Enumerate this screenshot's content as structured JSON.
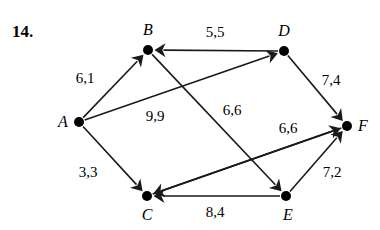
{
  "problem": {
    "number": "14."
  },
  "graph": {
    "nodes": [
      {
        "id": "A",
        "label": "A",
        "x": 79,
        "y": 122,
        "label_x": 63,
        "label_y": 122
      },
      {
        "id": "B",
        "label": "B",
        "x": 148,
        "y": 50,
        "label_x": 148,
        "label_y": 30
      },
      {
        "id": "C",
        "label": "C",
        "x": 147,
        "y": 196,
        "label_x": 147,
        "label_y": 215
      },
      {
        "id": "D",
        "label": "D",
        "x": 284,
        "y": 51,
        "label_x": 284,
        "label_y": 31
      },
      {
        "id": "E",
        "label": "E",
        "x": 286,
        "y": 196,
        "label_x": 288,
        "label_y": 215
      },
      {
        "id": "F",
        "label": "F",
        "x": 347,
        "y": 126,
        "label_x": 363,
        "label_y": 126
      }
    ],
    "edges": [
      {
        "from": "A",
        "to": "B",
        "weight": "6,1",
        "label_x": 85,
        "label_y": 78
      },
      {
        "from": "A",
        "to": "D",
        "weight": "9,9",
        "label_x": 155,
        "label_y": 116
      },
      {
        "from": "A",
        "to": "C",
        "weight": "3,3",
        "label_x": 88,
        "label_y": 172
      },
      {
        "from": "D",
        "to": "B",
        "weight": "5,5",
        "label_x": 215,
        "label_y": 32
      },
      {
        "from": "D",
        "to": "F",
        "weight": "7,4",
        "label_x": 331,
        "label_y": 80
      },
      {
        "from": "B",
        "to": "E",
        "weight": "6,6",
        "label_x": 232,
        "label_y": 110
      },
      {
        "from": "C",
        "to": "F",
        "weight": "6,6",
        "label_x": 288,
        "label_y": 128
      },
      {
        "from": "E",
        "to": "F",
        "weight": "7,2",
        "label_x": 332,
        "label_y": 172
      },
      {
        "from": "E",
        "to": "C",
        "weight": "8,4",
        "label_x": 215,
        "label_y": 212
      },
      {
        "from": "F",
        "to": "C",
        "weight": "",
        "label_x": 0,
        "label_y": 0
      }
    ],
    "style": {
      "stroke": "#1a1a1a",
      "node_fill": "#000000",
      "node_radius": 5,
      "edge_width": 1.6
    }
  }
}
